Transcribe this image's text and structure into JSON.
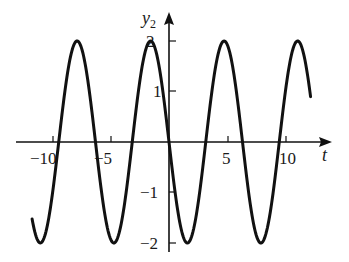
{
  "chart_data": {
    "type": "line",
    "title": "",
    "xlabel": "t",
    "ylabel": "y2",
    "xlim": [
      -11.7,
      12.1
    ],
    "ylim": [
      -2,
      2
    ],
    "x_ticks": [
      -10,
      -5,
      5,
      10
    ],
    "x_tick_labels": [
      "−10",
      "−5",
      "5",
      "10"
    ],
    "y_ticks": [
      2,
      1,
      -1,
      -2
    ],
    "y_tick_labels": [
      "2",
      "1",
      "−1",
      "−2"
    ],
    "grid": false,
    "legend": null,
    "series": [
      {
        "name": "y2 = -2 sin t",
        "formula": "-2*sin(t)",
        "amplitude": 2,
        "period": 6.283,
        "x": [
          -11.7,
          -11,
          -10,
          -9.42,
          -9,
          -8,
          -7.85,
          -7,
          -6.28,
          -6,
          -5,
          -4.71,
          -4,
          -3.14,
          -3,
          -2,
          -1.57,
          -1,
          0,
          1,
          1.57,
          2,
          3,
          3.14,
          4,
          4.71,
          5,
          6,
          6.28,
          7,
          7.85,
          8,
          9,
          9.42,
          10,
          11,
          12,
          12.1
        ],
        "values": [
          -1.46,
          -2.0,
          -1.09,
          0,
          0.82,
          1.98,
          2.0,
          1.31,
          0,
          -0.56,
          -1.92,
          -2.0,
          -1.51,
          0,
          0.28,
          1.82,
          2.0,
          1.68,
          0,
          -1.68,
          -2.0,
          -1.82,
          -0.28,
          0,
          1.51,
          2.0,
          1.92,
          0.56,
          0,
          -1.31,
          -2.0,
          -1.98,
          -0.82,
          0,
          1.09,
          2.0,
          1.07,
          0.87
        ]
      }
    ],
    "colors": {
      "line": "#111111",
      "axes": "#111111"
    }
  },
  "labels": {
    "x_axis": "t",
    "y_axis_main": "y",
    "y_axis_sub": "2",
    "xt0": "−10",
    "xt1": "−5",
    "xt2": "5",
    "xt3": "10",
    "yt0": "2",
    "yt1": "1",
    "yt2": "−1",
    "yt3": "−2"
  }
}
